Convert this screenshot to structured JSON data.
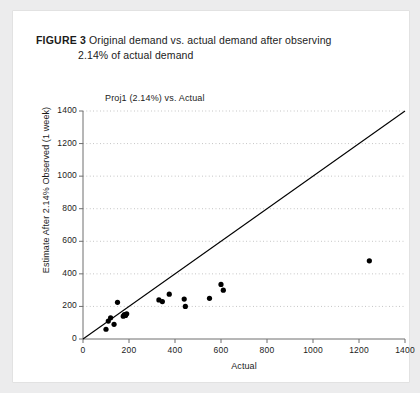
{
  "caption": {
    "figure_label": "FIGURE 3",
    "line1": "Original demand vs. actual demand after observing",
    "line2": "2.14% of actual demand"
  },
  "chart_data": {
    "type": "scatter",
    "title": "Proj1 (2.14%) vs. Actual",
    "xlabel": "Actual",
    "ylabel": "Estimate After 2.14% Observed (1 week)",
    "xlim": [
      0,
      1400
    ],
    "ylim": [
      0,
      1400
    ],
    "xticks": [
      0,
      200,
      400,
      600,
      800,
      1000,
      1200,
      1400
    ],
    "yticks": [
      0,
      200,
      400,
      600,
      800,
      1000,
      1200,
      1400
    ],
    "grid": "horizontal-dotted",
    "legend": "none",
    "marker_color": "#000000",
    "reference_line": {
      "label": "y = x",
      "from": [
        0,
        0
      ],
      "to": [
        1400,
        1400
      ],
      "color": "#000000"
    },
    "points": [
      {
        "x": 100,
        "y": 60
      },
      {
        "x": 110,
        "y": 110
      },
      {
        "x": 120,
        "y": 130
      },
      {
        "x": 135,
        "y": 90
      },
      {
        "x": 150,
        "y": 225
      },
      {
        "x": 175,
        "y": 140
      },
      {
        "x": 180,
        "y": 150
      },
      {
        "x": 185,
        "y": 145
      },
      {
        "x": 190,
        "y": 155
      },
      {
        "x": 330,
        "y": 240
      },
      {
        "x": 345,
        "y": 230
      },
      {
        "x": 375,
        "y": 275
      },
      {
        "x": 440,
        "y": 245
      },
      {
        "x": 445,
        "y": 200
      },
      {
        "x": 550,
        "y": 250
      },
      {
        "x": 600,
        "y": 335
      },
      {
        "x": 610,
        "y": 300
      },
      {
        "x": 1245,
        "y": 480
      }
    ]
  }
}
